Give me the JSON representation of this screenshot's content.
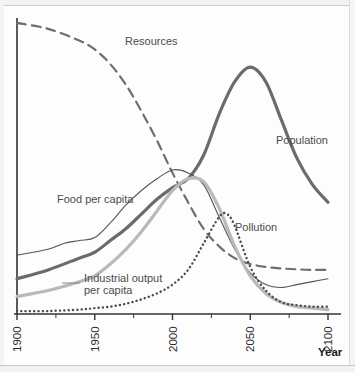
{
  "chart_data": {
    "type": "line",
    "title": "",
    "xlabel": "Year",
    "ylabel": "",
    "xlim": [
      1900,
      2100
    ],
    "ylim": [
      0,
      100
    ],
    "grid": false,
    "legend_position": "inline-annotations",
    "xticks": [
      1900,
      1950,
      2000,
      2050,
      2100
    ],
    "xtick_labels": [
      "1900",
      "1950",
      "2000",
      "2050",
      "2100"
    ],
    "minor_ticks": [
      1925,
      1975,
      2025,
      2075
    ],
    "series": [
      {
        "name": "Resources",
        "style": "dashed",
        "color": "#6e6e6e",
        "width": 2.2,
        "x": [
          1900,
          1920,
          1940,
          1950,
          1960,
          1970,
          1980,
          1990,
          2000,
          2010,
          2020,
          2030,
          2040,
          2050,
          2060,
          2070,
          2080,
          2090,
          2100
        ],
        "values": [
          99,
          97,
          93,
          90,
          85,
          78,
          69,
          59,
          48,
          38,
          29,
          23,
          19,
          17,
          16,
          15.5,
          15.2,
          15,
          15
        ]
      },
      {
        "name": "Population",
        "style": "solid-thick",
        "color": "#6b6b6b",
        "width": 3.2,
        "x": [
          1900,
          1920,
          1940,
          1950,
          1960,
          1970,
          1980,
          1990,
          2000,
          2010,
          2020,
          2030,
          2040,
          2050,
          2060,
          2070,
          2080,
          2090,
          2100
        ],
        "values": [
          12,
          15,
          19,
          21,
          25,
          29,
          34,
          39,
          43,
          46,
          54,
          68,
          79,
          84,
          79,
          66,
          53,
          44,
          38
        ]
      },
      {
        "name": "Food per capita",
        "style": "solid-thin",
        "color": "#555555",
        "width": 1.1,
        "x": [
          1900,
          1920,
          1930,
          1940,
          1950,
          1960,
          1970,
          1980,
          1990,
          2000,
          2010,
          2020,
          2030,
          2040,
          2050,
          2060,
          2070,
          2080,
          2090,
          2100
        ],
        "values": [
          20,
          22,
          24,
          25,
          26,
          31,
          37,
          42,
          46,
          49,
          48,
          44,
          33,
          22,
          14,
          10,
          9,
          10,
          11,
          12
        ]
      },
      {
        "name": "Industrial output per capita",
        "style": "solid-light",
        "color": "#b9b9b9",
        "width": 3.2,
        "x": [
          1900,
          1920,
          1940,
          1950,
          1960,
          1970,
          1980,
          1990,
          2000,
          2010,
          2020,
          2030,
          2040,
          2050,
          2060,
          2070,
          2080,
          2090,
          2100
        ],
        "values": [
          6,
          8,
          11,
          13,
          17,
          22,
          28,
          35,
          42,
          46,
          45,
          36,
          23,
          13,
          7,
          4,
          2.5,
          2,
          1.5
        ]
      },
      {
        "name": "Pollution",
        "style": "dotted",
        "color": "#4a4a4a",
        "width": 2.4,
        "x": [
          1900,
          1920,
          1940,
          1950,
          1960,
          1970,
          1980,
          1990,
          2000,
          2010,
          2020,
          2030,
          2035,
          2040,
          2050,
          2060,
          2070,
          2080,
          2090,
          2100
        ],
        "values": [
          1,
          1,
          1.5,
          2,
          2.5,
          3.5,
          5,
          7,
          10,
          15,
          24,
          33,
          34,
          30,
          16,
          8,
          4,
          3,
          2.5,
          2.5
        ]
      }
    ],
    "annotations": [
      {
        "id": "resources-label",
        "text": "Resources",
        "x_px": 125,
        "y_px": 35
      },
      {
        "id": "population-label",
        "text": "Population",
        "x_px": 276,
        "y_px": 134
      },
      {
        "id": "food-label",
        "text": "Food per capita",
        "x_px": 57,
        "y_px": 193
      },
      {
        "id": "pollution-label",
        "text": "Pollution",
        "x_px": 235,
        "y_px": 221
      },
      {
        "id": "industrial-label-1",
        "text": "Industrial output",
        "x_px": 84,
        "y_px": 272
      },
      {
        "id": "industrial-label-2",
        "text": "per capita",
        "x_px": 84,
        "y_px": 284
      }
    ]
  },
  "axis": {
    "title": "Year",
    "title_x_px": 318,
    "title_y_px": 346
  },
  "colors": {
    "resources": "#6e6e6e",
    "population": "#6b6b6b",
    "food": "#555555",
    "industrial": "#b9b9b9",
    "pollution": "#4a4a4a",
    "axis": "#333333",
    "text": "#4c4c4c"
  }
}
